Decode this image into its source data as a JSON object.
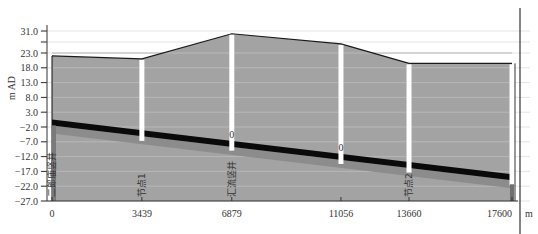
{
  "chart_data": {
    "type": "area",
    "title": "",
    "xlabel": "m",
    "ylabel": "m AD",
    "xlim": [
      0,
      17600
    ],
    "ylim": [
      -27.0,
      31.0
    ],
    "grid": true,
    "y_ticks": [
      "31.0",
      "23.0",
      "18.0",
      "13.0",
      "8.0",
      "3.0",
      "-2.0",
      "-7.0",
      "-12.0",
      "-17.0",
      "-22.0",
      "-27.0"
    ],
    "y_tick_values": [
      31.0,
      23.0,
      18.0,
      13.0,
      8.0,
      3.0,
      -2.0,
      -7.0,
      -12.0,
      -17.0,
      -22.0,
      -27.0
    ],
    "x_ticks": [
      "0",
      "3439",
      "6879",
      "11056",
      "13660",
      "17600"
    ],
    "x_tick_values": [
      0,
      3439,
      6879,
      11056,
      13660,
      17600
    ],
    "nodes": [
      {
        "name": "二郎庙竖井",
        "chainage": 0,
        "ground": 22.0,
        "invert": -1.5,
        "label_value": ""
      },
      {
        "name": "节点1",
        "chainage": 3439,
        "ground": 21.0,
        "invert": -5.0,
        "label_value": ""
      },
      {
        "name": "汇流竖井",
        "chainage": 6879,
        "ground": 30.0,
        "invert": -8.3,
        "label_value": "0"
      },
      {
        "name": "",
        "chainage": 11056,
        "ground": 26.3,
        "invert": -12.8,
        "label_value": "0"
      },
      {
        "name": "节点2",
        "chainage": 13660,
        "ground": 19.5,
        "invert": -15.7,
        "label_value": ""
      },
      {
        "name": "",
        "chainage": 17600,
        "ground": 19.5,
        "invert": -20.0,
        "label_value": ""
      }
    ],
    "series": [
      {
        "name": "ground_level",
        "x": [
          0,
          3439,
          6879,
          11056,
          13660,
          17600
        ],
        "values": [
          22.0,
          21.0,
          30.0,
          26.3,
          19.5,
          19.5
        ]
      },
      {
        "name": "pipe_crown",
        "x": [
          0,
          17600
        ],
        "values": [
          0.5,
          -18.0
        ]
      },
      {
        "name": "pipe_invert",
        "x": [
          0,
          17600
        ],
        "values": [
          -1.5,
          -20.0
        ]
      },
      {
        "name": "water_level",
        "x": [
          0,
          17600
        ],
        "values": [
          -1.5,
          -20.0
        ]
      }
    ],
    "colors": {
      "fill": "#a3a3a3",
      "lower_fill": "#8c8c8c",
      "pipe": "#0a0a0a",
      "ground_line": "#1a1a1a",
      "grid": "#d0d0d0",
      "node_column": "#ffffff"
    }
  }
}
